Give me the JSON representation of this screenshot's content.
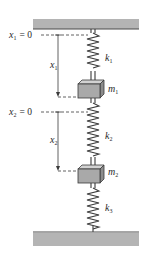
{
  "diagram": {
    "type": "two-mass three-spring system between fixed walls",
    "colors": {
      "wall_fill": "#b4b4b4",
      "wall_edge": "#4a4a4a",
      "mass_front": "#a9a9a9",
      "mass_top": "#d2d2d2",
      "mass_side": "#8c8c8c",
      "spring": "#3a3a3a",
      "dash": "#3a3a3a"
    },
    "reference_labels": [
      {
        "var": "x",
        "sub": "1",
        "text": "= 0"
      },
      {
        "var": "x",
        "sub": "2",
        "text": "= 0"
      }
    ],
    "displacement_labels": [
      {
        "var": "x",
        "sub": "1"
      },
      {
        "var": "x",
        "sub": "2"
      }
    ],
    "springs": [
      {
        "var": "k",
        "sub": "1"
      },
      {
        "var": "k",
        "sub": "2"
      },
      {
        "var": "k",
        "sub": "3"
      }
    ],
    "masses": [
      {
        "var": "m",
        "sub": "1"
      },
      {
        "var": "m",
        "sub": "2"
      }
    ]
  }
}
